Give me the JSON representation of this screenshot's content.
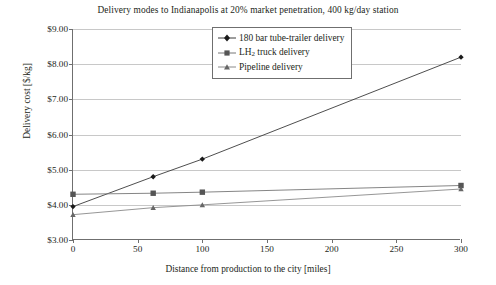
{
  "chart_data": {
    "type": "line",
    "title": "Delivery modes to Indianapolis at 20% market penetration, 400 kg/day station",
    "xlabel": "Distance from production to the city [miles]",
    "ylabel": "Delivery cost [$/kg]",
    "xlim": [
      0,
      300
    ],
    "ylim": [
      3.0,
      9.0
    ],
    "xticks": [
      0,
      50,
      100,
      150,
      200,
      250,
      300
    ],
    "xtick_labels": [
      "0",
      "50",
      "100",
      "150",
      "200",
      "250",
      "300"
    ],
    "yticks": [
      3.0,
      4.0,
      5.0,
      6.0,
      7.0,
      8.0,
      9.0
    ],
    "ytick_labels": [
      "$3.00",
      "$4.00",
      "$5.00",
      "$6.00",
      "$7.00",
      "$8.00",
      "$9.00"
    ],
    "grid": "horizontal",
    "legend_position": "top-center",
    "series": [
      {
        "name": "180 bar tube-trailer delivery",
        "marker": "diamond",
        "color": "#3a3a3a",
        "x": [
          0,
          62,
          100,
          300
        ],
        "values": [
          3.95,
          4.8,
          5.3,
          8.2
        ]
      },
      {
        "name": "LH2 truck delivery",
        "marker": "square",
        "color": "#777777",
        "x": [
          0,
          62,
          100,
          300
        ],
        "values": [
          4.3,
          4.33,
          4.36,
          4.55
        ]
      },
      {
        "name": "Pipeline delivery",
        "marker": "triangle",
        "color": "#8a8a8a",
        "x": [
          0,
          62,
          100,
          300
        ],
        "values": [
          3.72,
          3.92,
          4.0,
          4.45
        ]
      }
    ]
  },
  "legend": {
    "entries": [
      {
        "label": "180 bar tube-trailer delivery",
        "marker": "diamond-marker-icon"
      },
      {
        "label_pre": "LH",
        "label_sub": "2",
        "label_post": " truck delivery",
        "marker": "square-marker-icon"
      },
      {
        "label": "Pipeline delivery",
        "marker": "triangle-marker-icon"
      }
    ]
  }
}
